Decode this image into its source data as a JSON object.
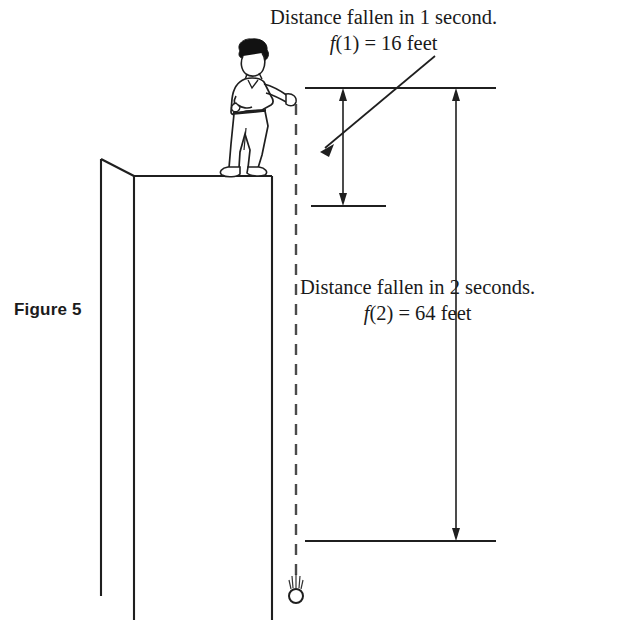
{
  "figure": {
    "label": "Figure 5"
  },
  "callouts": {
    "first": {
      "line1": "Distance fallen in 1 second.",
      "line2_fn": "f",
      "line2_rest": "(1) = 16 feet",
      "time_seconds": 1,
      "distance_feet": 16
    },
    "second": {
      "line1": "Distance fallen in 2 seconds.",
      "line2_fn": "f",
      "line2_rest": "(2) = 64 feet",
      "time_seconds": 2,
      "distance_feet": 64
    }
  },
  "scene": {
    "person": "person-dropping-object",
    "cliff": "cliff-block",
    "ball": "falling-ball",
    "trajectory": "dashed-fall-path"
  },
  "colors": {
    "ink": "#141414",
    "line": "#222222",
    "background": "#ffffff",
    "hair": "#111111"
  }
}
